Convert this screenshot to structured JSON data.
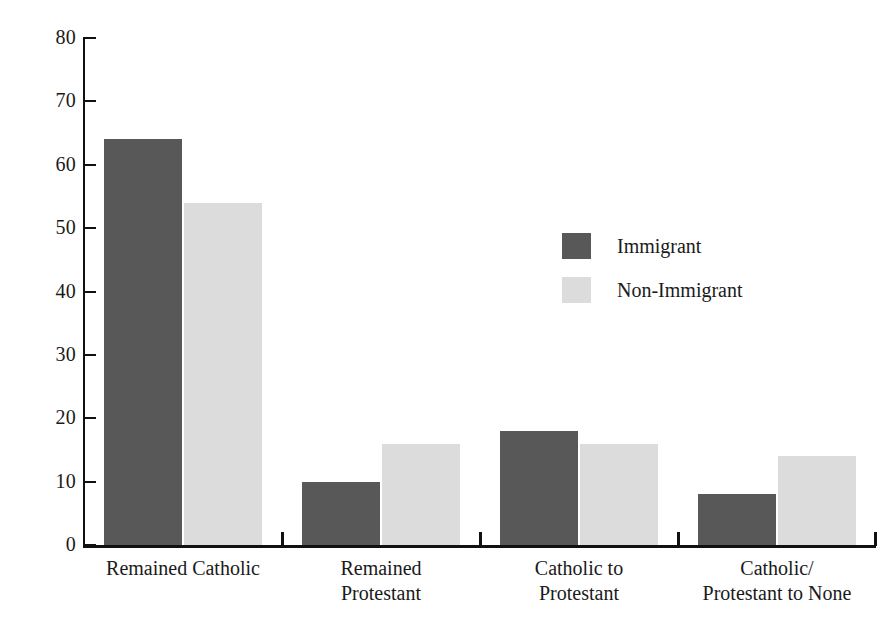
{
  "chart_data": {
    "type": "bar",
    "title": "",
    "subtitle": "",
    "xlabel": "",
    "ylabel": "",
    "ylim": [
      0,
      80
    ],
    "y_ticks": [
      0,
      10,
      20,
      30,
      40,
      50,
      60,
      70,
      80
    ],
    "y_tick_labels": [
      "0",
      "10",
      "20",
      "30",
      "40",
      "50",
      "60",
      "70",
      "80"
    ],
    "grid": false,
    "legend_position": "upper-right-inside",
    "categories": [
      "Remained Catholic",
      "Remained\nProtestant",
      "Catholic to\nProtestant",
      "Catholic/\nProtestant to None"
    ],
    "series": [
      {
        "name": "Immigrant",
        "color": "#585858",
        "values": [
          64,
          10,
          18,
          8
        ]
      },
      {
        "name": "Non-Immigrant",
        "color": "#dcdcdc",
        "values": [
          54,
          16,
          16,
          14
        ]
      }
    ]
  },
  "legend": {
    "items": [
      {
        "label": "Immigrant",
        "swatch": "dark"
      },
      {
        "label": "Non-Immigrant",
        "swatch": "light"
      }
    ]
  },
  "colors": {
    "series_dark": "#585858",
    "series_light": "#dcdcdc",
    "axis": "#111111",
    "text": "#1a1a1a",
    "background": "#ffffff"
  }
}
